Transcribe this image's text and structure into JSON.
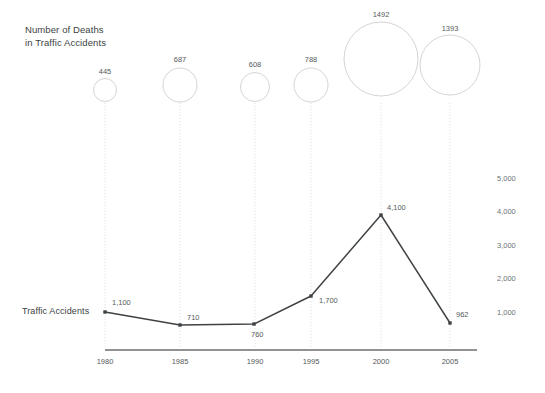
{
  "title": "Number of Deaths\nin Traffic Accidents",
  "series_label": "Traffic Accidents",
  "colors": {
    "line": "#3f4346",
    "bubble_stroke": "#cfcfcf",
    "guide": "#d6d6d6",
    "axis": "#6b6f72",
    "text": "#55595c",
    "background": "#ffffff"
  },
  "chart_data": {
    "type": "line",
    "title": "Number of Deaths in Traffic Accidents",
    "xlabel": "",
    "ylabel": "",
    "grid": false,
    "legend_position": "none",
    "categories": [
      "1980",
      "1985",
      "1990",
      "1995",
      "2000",
      "2005"
    ],
    "x": [
      1980,
      1985,
      1990,
      1995,
      2000,
      2005
    ],
    "ylim": [
      0,
      5000
    ],
    "y_ticks": [
      1000,
      2000,
      3000,
      4000,
      5000
    ],
    "y_tick_labels": [
      "1,000",
      "2,000",
      "3,000",
      "4,000",
      "5,000"
    ],
    "series": [
      {
        "name": "Traffic Accidents",
        "type": "line",
        "values": [
          1100,
          710,
          760,
          1700,
          4100,
          962
        ],
        "value_labels": [
          "1,100",
          "710",
          "760",
          "1,700",
          "4,100",
          "962"
        ]
      },
      {
        "name": "Number of Deaths in Traffic Accidents",
        "type": "bubble",
        "values": [
          445,
          687,
          608,
          788,
          1492,
          1393
        ],
        "value_labels": [
          "445",
          "687",
          "608",
          "788",
          "1492",
          "1393"
        ]
      }
    ]
  },
  "bubbles": [
    {
      "label": "445",
      "cx": 105,
      "cy": 90,
      "r": 11.5,
      "label_x": 105,
      "label_y": 74
    },
    {
      "label": "687",
      "cx": 180,
      "cy": 85,
      "r": 17,
      "label_x": 180,
      "label_y": 62
    },
    {
      "label": "608",
      "cx": 255,
      "cy": 87,
      "r": 14.5,
      "label_x": 255,
      "label_y": 67
    },
    {
      "label": "788",
      "cx": 311,
      "cy": 85,
      "r": 17,
      "label_x": 311,
      "label_y": 62
    },
    {
      "label": "1492",
      "cx": 381,
      "cy": 59,
      "r": 37,
      "label_x": 381,
      "label_y": 17
    },
    {
      "label": "1393",
      "cx": 450,
      "cy": 65,
      "r": 30,
      "label_x": 450,
      "label_y": 31
    }
  ],
  "points": [
    {
      "label": "1,100",
      "cx": 105,
      "cy": 312,
      "label_x": 112,
      "label_y": 305
    },
    {
      "label": "710",
      "cx": 180,
      "cy": 325,
      "label_x": 187,
      "label_y": 320
    },
    {
      "label": "760",
      "cx": 254,
      "cy": 324,
      "label_x": 251,
      "label_y": 337
    },
    {
      "label": "1,700",
      "cx": 311,
      "cy": 296,
      "label_x": 319,
      "label_y": 303
    },
    {
      "label": "4,100",
      "cx": 381,
      "cy": 215,
      "label_x": 387,
      "label_y": 210
    },
    {
      "label": "962",
      "cx": 450,
      "cy": 323,
      "label_x": 456,
      "label_y": 317
    }
  ],
  "guides": [
    {
      "x": 105
    },
    {
      "x": 180
    },
    {
      "x": 255
    },
    {
      "x": 311
    },
    {
      "x": 381
    },
    {
      "x": 450
    }
  ],
  "x_ticks": [
    {
      "label": "1980",
      "x": 105
    },
    {
      "label": "1985",
      "x": 180
    },
    {
      "label": "1990",
      "x": 255
    },
    {
      "label": "1995",
      "x": 311
    },
    {
      "label": "2000",
      "x": 381
    },
    {
      "label": "2005",
      "x": 450
    }
  ],
  "y_ticks": [
    {
      "label": "5,000",
      "y": 181
    },
    {
      "label": "4,000",
      "y": 214
    },
    {
      "label": "3,000",
      "y": 248
    },
    {
      "label": "2,000",
      "y": 281
    },
    {
      "label": "1,000",
      "y": 315
    }
  ],
  "axis": {
    "x1": 105,
    "x2": 477,
    "y": 350
  }
}
